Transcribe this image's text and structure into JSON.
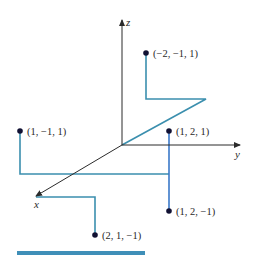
{
  "figure": {
    "colors": {
      "axis": "#2b2b2b",
      "teal_guide": "#3b8fae",
      "blue_guide": "#3a78c8",
      "point": "#111133",
      "bottom_bar": "#3f8fb8"
    },
    "axes": {
      "x": {
        "label": "x"
      },
      "y": {
        "label": "y"
      },
      "z": {
        "label": "z"
      }
    },
    "points": [
      {
        "id": "p1",
        "label": "(−2, −1, 1)",
        "coords": [
          -2,
          -1,
          1
        ]
      },
      {
        "id": "p2",
        "label": "(1, −1, 1)",
        "coords": [
          1,
          -1,
          1
        ]
      },
      {
        "id": "p3",
        "label": "(1, 2, 1)",
        "coords": [
          1,
          2,
          1
        ]
      },
      {
        "id": "p4",
        "label": "(1, 2, −1)",
        "coords": [
          1,
          2,
          -1
        ]
      },
      {
        "id": "p5",
        "label": "(2, 1, −1)",
        "coords": [
          2,
          1,
          -1
        ]
      }
    ]
  }
}
